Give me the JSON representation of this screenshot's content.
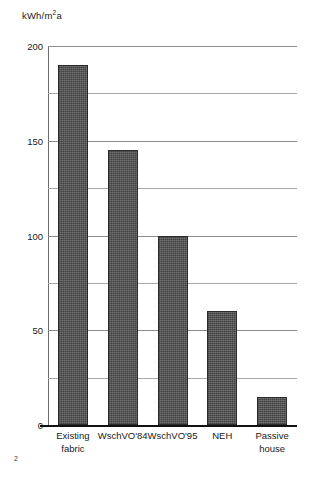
{
  "page": {
    "number": "2"
  },
  "chart_data": {
    "type": "bar",
    "title": "",
    "xlabel": "",
    "ylabel": "kWh/m²a",
    "ylabel_parts": {
      "before": "kWh/m",
      "superscript": "2",
      "after": "a"
    },
    "categories": [
      "Existing\nfabric",
      "WschVO'84",
      "WschVO'95",
      "NEH",
      "Passive\nhouse"
    ],
    "values": [
      190,
      145,
      100,
      60,
      15
    ],
    "ylim": [
      0,
      200
    ],
    "yticks": [
      0,
      50,
      100,
      150,
      200
    ],
    "ytick_labels": [
      "0",
      "50",
      "100",
      "150",
      "200"
    ],
    "yticks_minor": [
      25,
      75,
      125,
      175
    ],
    "grid": true,
    "legend": false,
    "bar_color": "#5c5c5c",
    "bar_edge_color": "#2b2b2b",
    "gridline_color": "#8e8e8e",
    "axis_color": "#111111",
    "background": "#ffffff"
  }
}
